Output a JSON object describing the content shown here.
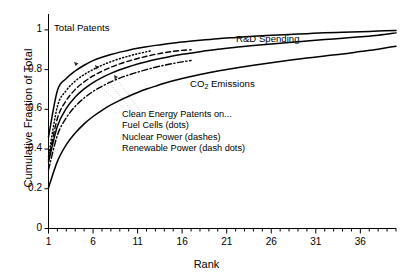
{
  "chart_data": {
    "type": "line",
    "title": "",
    "xlabel": "Rank",
    "ylabel": "Cumulative Fraction of Total",
    "xlim": [
      1,
      40
    ],
    "ylim": [
      0,
      1.08
    ],
    "xticks": [
      1,
      6,
      11,
      16,
      21,
      26,
      31,
      36
    ],
    "yticks": [
      0,
      0.2,
      0.4,
      0.6,
      0.8,
      1
    ],
    "xtick_labels": [
      "1",
      "6",
      "11",
      "16",
      "21",
      "26",
      "31",
      "36"
    ],
    "ytick_labels": [
      "0",
      "0.2",
      "0.4",
      "0.6",
      "0.8",
      "1"
    ],
    "grid": false,
    "legend": "annotations-inline",
    "series": [
      {
        "name": "Total Patents",
        "style": "solid",
        "x": [
          1,
          2,
          3,
          4,
          5,
          6,
          7,
          8,
          9,
          10,
          11,
          12,
          13,
          14,
          16,
          18,
          20,
          22,
          24,
          26,
          28,
          30,
          32,
          34,
          36,
          38,
          40
        ],
        "values": [
          0.46,
          0.695,
          0.755,
          0.793,
          0.822,
          0.845,
          0.862,
          0.876,
          0.888,
          0.898,
          0.907,
          0.915,
          0.922,
          0.928,
          0.939,
          0.948,
          0.956,
          0.962,
          0.968,
          0.973,
          0.977,
          0.981,
          0.985,
          0.988,
          0.991,
          0.994,
          0.997
        ]
      },
      {
        "name": "Fuel Cells (dots)",
        "style": "dotted",
        "x": [
          1,
          2,
          3,
          4,
          5,
          6,
          7,
          8,
          9,
          10,
          11,
          12,
          12.5
        ],
        "values": [
          0.36,
          0.615,
          0.695,
          0.742,
          0.775,
          0.8,
          0.822,
          0.84,
          0.855,
          0.868,
          0.88,
          0.89,
          0.895
        ]
      },
      {
        "name": "Nuclear Power (dashes)",
        "style": "dashed",
        "x": [
          1,
          2,
          3,
          4,
          5,
          6,
          7,
          8,
          9,
          10,
          11,
          12,
          13,
          14,
          15,
          16,
          17
        ],
        "values": [
          0.345,
          0.555,
          0.645,
          0.7,
          0.738,
          0.768,
          0.792,
          0.812,
          0.829,
          0.843,
          0.856,
          0.867,
          0.877,
          0.885,
          0.892,
          0.897,
          0.9
        ]
      },
      {
        "name": "R&D Spending",
        "style": "solid",
        "x": [
          1,
          2,
          3,
          4,
          5,
          6,
          7,
          8,
          9,
          10,
          11,
          12,
          13,
          14,
          16,
          18,
          20,
          22,
          24,
          26,
          28,
          30,
          32,
          34,
          36,
          38,
          40
        ],
        "values": [
          0.335,
          0.515,
          0.605,
          0.662,
          0.703,
          0.735,
          0.76,
          0.781,
          0.799,
          0.814,
          0.828,
          0.84,
          0.851,
          0.86,
          0.877,
          0.89,
          0.902,
          0.912,
          0.921,
          0.929,
          0.937,
          0.944,
          0.951,
          0.958,
          0.965,
          0.973,
          0.985
        ]
      },
      {
        "name": "Renewable Power (dash dots)",
        "style": "dashdot",
        "x": [
          1,
          2,
          3,
          4,
          5,
          6,
          7,
          8,
          9,
          10,
          11,
          12,
          13,
          14,
          15,
          16,
          17
        ],
        "values": [
          0.295,
          0.47,
          0.558,
          0.615,
          0.657,
          0.69,
          0.716,
          0.738,
          0.757,
          0.773,
          0.787,
          0.8,
          0.812,
          0.822,
          0.831,
          0.839,
          0.846
        ]
      },
      {
        "name": "CO2 Emissions",
        "style": "solid",
        "x": [
          1,
          2,
          3,
          4,
          5,
          6,
          7,
          8,
          9,
          10,
          11,
          12,
          13,
          14,
          16,
          18,
          20,
          22,
          24,
          26,
          28,
          30,
          32,
          34,
          36,
          38,
          40
        ],
        "values": [
          0.205,
          0.338,
          0.422,
          0.481,
          0.527,
          0.564,
          0.595,
          0.622,
          0.645,
          0.666,
          0.685,
          0.702,
          0.717,
          0.731,
          0.755,
          0.775,
          0.793,
          0.808,
          0.822,
          0.835,
          0.847,
          0.858,
          0.869,
          0.879,
          0.891,
          0.903,
          0.918
        ]
      }
    ],
    "curve_labels": [
      {
        "id": "total-patents",
        "text": "Total Patents",
        "x": 54,
        "y": 27
      },
      {
        "id": "rd-spending",
        "text": "R&D Spending",
        "x": 236,
        "y": 38
      },
      {
        "id": "co2-emissions",
        "text_pre": "CO",
        "text_sub": "2",
        "text_post": " Emissions",
        "x": 190,
        "y": 83
      }
    ],
    "annotation_block": [
      "Clean Energy Patents on...",
      "Fuel Cells (dots)",
      "Nuclear Power (dashes)",
      "Renewable Power (dash dots)"
    ],
    "colors": {
      "line": "#000000",
      "leader": "#b8b8b8",
      "axis": "#000000"
    }
  }
}
